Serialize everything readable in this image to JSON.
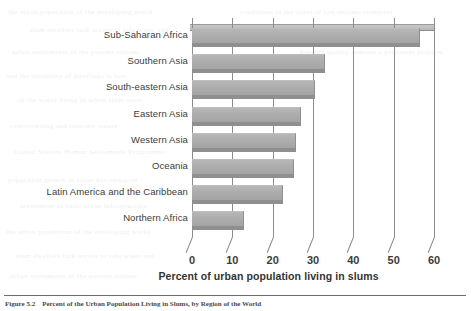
{
  "chart_data": {
    "type": "bar",
    "orientation": "horizontal",
    "title": "",
    "xlabel": "Percent of urban population living in slums",
    "ylabel": "",
    "xlim": [
      0,
      60
    ],
    "xticks": [
      "0",
      "10",
      "20",
      "30",
      "40",
      "50",
      "60"
    ],
    "grid": true,
    "legend": "none",
    "bar_color": "#ababab",
    "categories": [
      "Sub-Saharan Africa",
      "Southern Asia",
      "South-eastern Asia",
      "Eastern Asia",
      "Western Asia",
      "Oceania",
      "Latin America and the Caribbean",
      "Northern Africa"
    ],
    "values": [
      56.5,
      33,
      30.5,
      27,
      25.8,
      25.3,
      22.5,
      13
    ]
  },
  "figure": {
    "axis_title": "Percent of urban population living in slums",
    "caption_number": "Figure 5.2",
    "caption_text": "Percent of the Urban Population Living in Slums, by Region of the World"
  },
  "bleed_text": [
    "the urban population of the developing world",
    "conditions in the cities of low-income countries",
    "slum dwellers lack access to safe water and",
    "sanitation facilities in the rapidly growing",
    "urban settlements of the poorest nations",
    "housing quality remains a persistent problem",
    "and the durability of dwellings is low",
    "of the world living in urban slum areas",
    "overcrowding and insecure tenure",
    "United Nations Human Settlements Programme",
    "population growth in cities has outpaced",
    "investment in basic urban infrastructure"
  ]
}
